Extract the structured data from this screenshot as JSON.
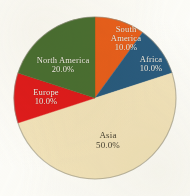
{
  "figure": {
    "background_color": "#fdfdfa",
    "pie": {
      "center_x": 95,
      "center_y": 98,
      "radius": 81,
      "outline_color": "#8d8a7c",
      "start_angle_deg": 0,
      "direction": "clockwise"
    }
  },
  "chart_data": {
    "type": "pie",
    "title": "",
    "subtitle": "",
    "xlabel": "",
    "ylabel": "",
    "grid": false,
    "legend_position": "none",
    "label_format": "name + percent",
    "start_angle_deg": 90,
    "counterclock": false,
    "categories": [
      "South America",
      "Africa",
      "Asia",
      "Europe",
      "North America"
    ],
    "values": [
      10.0,
      10.0,
      50.0,
      10.0,
      20.0
    ],
    "value_suffix": "%",
    "colors": [
      "#e8601c",
      "#2c5c80",
      "#f2e4bc",
      "#e01b1b",
      "#4c7033"
    ],
    "slices": [
      {
        "name": "South America",
        "value": 10.0,
        "label": "South\nAmerica",
        "label_line1": "South",
        "label_line2": "America",
        "value_label": "10.0%",
        "color": "#e8601c",
        "text_color": "#f4f2e9",
        "start_deg": 0,
        "end_deg": 36
      },
      {
        "name": "Africa",
        "value": 10.0,
        "label": "Africa",
        "label_line1": "Africa",
        "label_line2": "",
        "value_label": "10.0%",
        "color": "#2c5c80",
        "text_color": "#f4f2e9",
        "start_deg": 36,
        "end_deg": 72
      },
      {
        "name": "Asia",
        "value": 50.0,
        "label": "Asia",
        "label_line1": "Asia",
        "label_line2": "",
        "value_label": "50.0%",
        "color": "#f2e4bc",
        "text_color": "#4a4435",
        "start_deg": 72,
        "end_deg": 252
      },
      {
        "name": "Europe",
        "value": 10.0,
        "label": "Europe",
        "label_line1": "Europe",
        "label_line2": "",
        "value_label": "10.0%",
        "color": "#e01b1b",
        "text_color": "#f4f2e9",
        "start_deg": 252,
        "end_deg": 288
      },
      {
        "name": "North America",
        "value": 20.0,
        "label": "North America",
        "label_line1": "North America",
        "label_line2": "",
        "value_label": "20.0%",
        "color": "#4c7033",
        "text_color": "#f4f2e9",
        "start_deg": 288,
        "end_deg": 360
      }
    ]
  }
}
